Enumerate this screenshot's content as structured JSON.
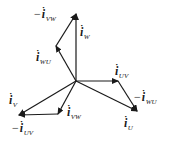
{
  "diagram": {
    "type": "phasor-diagram",
    "origin": {
      "x": 76,
      "y": 81
    },
    "stroke_color": "#1a1a1a",
    "vectors": [
      {
        "name": "i_W",
        "from": [
          76,
          81
        ],
        "to": [
          76,
          14
        ]
      },
      {
        "name": "i_WU",
        "from": [
          76,
          81
        ],
        "to": [
          56,
          46
        ]
      },
      {
        "name": "-i_VW",
        "from": [
          56,
          46
        ],
        "to": [
          76,
          14
        ]
      },
      {
        "name": "i_UV",
        "from": [
          76,
          81
        ],
        "to": [
          118,
          81
        ]
      },
      {
        "name": "-i_WU",
        "from": [
          118,
          81
        ],
        "to": [
          137,
          111
        ]
      },
      {
        "name": "i_U",
        "from": [
          76,
          81
        ],
        "to": [
          137,
          111
        ]
      },
      {
        "name": "i_VW",
        "from": [
          76,
          81
        ],
        "to": [
          58,
          114
        ]
      },
      {
        "name": "-i_UV",
        "from": [
          58,
          114
        ],
        "to": [
          19,
          115
        ]
      },
      {
        "name": "i_V",
        "from": [
          76,
          81
        ],
        "to": [
          19,
          115
        ]
      }
    ],
    "labels": {
      "neg_i_vw": {
        "neg": "−",
        "main": "i",
        "hat": "·",
        "sub": "VW"
      },
      "i_w": {
        "neg": "",
        "main": "i",
        "hat": "·",
        "sub": "W"
      },
      "i_wu": {
        "neg": "",
        "main": "i",
        "hat": "·",
        "sub": "WU"
      },
      "i_uv": {
        "neg": "",
        "main": "i",
        "hat": "·",
        "sub": "UV"
      },
      "neg_i_wu": {
        "neg": "−",
        "main": "i",
        "hat": "·",
        "sub": "WU"
      },
      "i_u": {
        "neg": "",
        "main": "i",
        "hat": "·",
        "sub": "U"
      },
      "i_v": {
        "neg": "",
        "main": "i",
        "hat": "·",
        "sub": "V"
      },
      "i_vw": {
        "neg": "",
        "main": "i",
        "hat": "·",
        "sub": "VW"
      },
      "neg_i_uv": {
        "neg": "−",
        "main": "i",
        "hat": "·",
        "sub": "UV"
      }
    }
  }
}
